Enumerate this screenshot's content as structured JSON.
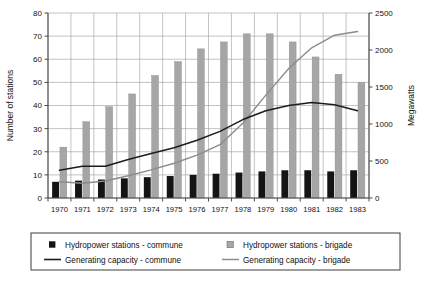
{
  "chart_data": {
    "type": "bar",
    "title": "",
    "subtitle": "",
    "xlabel": "",
    "ylabel": "Number of stations",
    "y2label": "Megawatts",
    "grid": true,
    "legend_position": "bottom",
    "categories": [
      "1970",
      "1971",
      "1972",
      "1973",
      "1974",
      "1975",
      "1976",
      "1977",
      "1978",
      "1979",
      "1980",
      "1981",
      "1982",
      "1983"
    ],
    "ylim": [
      0,
      80
    ],
    "yticks": [
      0,
      10,
      20,
      30,
      40,
      50,
      60,
      70,
      80
    ],
    "y2lim": [
      0,
      2500
    ],
    "y2ticks": [
      0,
      500,
      1000,
      1500,
      2000,
      2500
    ],
    "series": [
      {
        "name": "Hydropower stations - commune",
        "kind": "bar",
        "axis": "left",
        "color": "#141414",
        "values": [
          7,
          7.5,
          8,
          8.5,
          9,
          9.5,
          10,
          10.5,
          11,
          11.5,
          12,
          12,
          11.5,
          12
        ]
      },
      {
        "name": "Hydropower stations - brigade",
        "kind": "bar",
        "axis": "left",
        "color": "#a6a6a6",
        "values": [
          22,
          33,
          39.5,
          45,
          53,
          59,
          64.5,
          67.5,
          71,
          71,
          67.5,
          61,
          53.5,
          50
        ]
      },
      {
        "name": "Generating capacity - commune",
        "kind": "line",
        "axis": "right",
        "color": "#1c1c1c",
        "values": [
          375,
          430,
          430,
          520,
          600,
          680,
          780,
          900,
          1060,
          1180,
          1250,
          1290,
          1260,
          1180
        ]
      },
      {
        "name": "Generating capacity - brigade",
        "kind": "line",
        "axis": "right",
        "color": "#8c8c8c",
        "values": [
          220,
          200,
          230,
          300,
          380,
          470,
          580,
          720,
          1010,
          1390,
          1750,
          2030,
          2200,
          2250
        ]
      }
    ]
  },
  "legend": {
    "items": [
      {
        "label": "Hydropower stations - commune",
        "marker": "square-dark-icon"
      },
      {
        "label": "Hydropower stations - brigade",
        "marker": "square-grey-icon"
      },
      {
        "label": "Generating capacity - commune",
        "marker": "line-dark-icon"
      },
      {
        "label": "Generating capacity - brigade",
        "marker": "line-grey-icon"
      }
    ]
  },
  "axes": {
    "left_title": "Number of stations",
    "right_title": "Megawatts",
    "left_ticks": [
      "0",
      "10",
      "20",
      "30",
      "40",
      "50",
      "60",
      "70",
      "80"
    ],
    "right_ticks": [
      "0",
      "500",
      "1000",
      "1500",
      "2000",
      "2500"
    ],
    "year_ticks": [
      "1970",
      "1971",
      "1972",
      "1973",
      "1974",
      "1975",
      "1976",
      "1977",
      "1978",
      "1979",
      "1980",
      "1981",
      "1982",
      "1983"
    ]
  },
  "colors": {
    "bar_commune": "#141414",
    "bar_brigade": "#a6a6a6",
    "line_commune": "#1c1c1c",
    "line_brigade": "#8c8c8c",
    "grid": "#9a9a9a",
    "axis": "#4a4a4a",
    "background": "#ffffff"
  }
}
